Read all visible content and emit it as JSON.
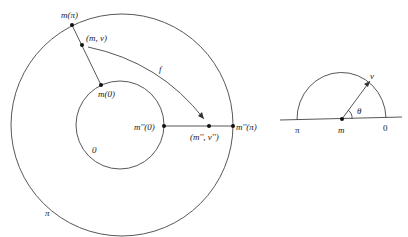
{
  "diagram": {
    "left_figure": {
      "outer_circle_label": "π",
      "inner_circle_label": "0",
      "points": {
        "m_pi": "m(π)",
        "m_v": "(m, v)",
        "m_0": "m(0)",
        "m2_0": "m''(0)",
        "m2_v2": "(m'', v'')",
        "m2_pi": "m''(π)"
      },
      "map_label": "f"
    },
    "right_figure": {
      "left_label": "π",
      "center_label": "m",
      "right_label": "0",
      "vector_label": "v",
      "angle_label": "θ"
    },
    "colors": {
      "stroke": "#333333",
      "background": "#ffffff"
    }
  }
}
